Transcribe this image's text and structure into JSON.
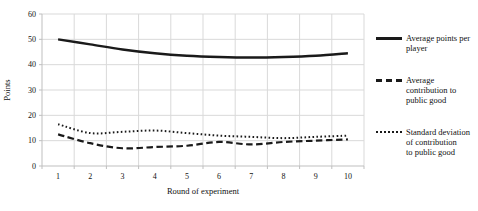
{
  "chart_data": {
    "type": "line",
    "title": "",
    "xlabel": "Round of experiment",
    "ylabel": "Points",
    "categories": [
      "1",
      "2",
      "3",
      "4",
      "5",
      "6",
      "7",
      "8",
      "9",
      "10"
    ],
    "ylim": [
      0,
      60
    ],
    "yticks": [
      0,
      10,
      20,
      30,
      40,
      50,
      60
    ],
    "grid": true,
    "legend_position": "right",
    "series": [
      {
        "name": "Average points per player",
        "legend_lines": [
          "Average points per",
          "player"
        ],
        "style": "solid",
        "values": [
          50,
          48,
          46,
          44.5,
          43.5,
          43,
          42.8,
          43,
          43.5,
          44.5
        ]
      },
      {
        "name": "Average contribution to public good",
        "legend_lines": [
          "Average",
          "contribution to",
          "public good"
        ],
        "style": "dashed",
        "values": [
          12.5,
          9,
          7,
          7.5,
          8,
          9.5,
          8.5,
          9.5,
          10,
          10.5
        ]
      },
      {
        "name": "Standard deviation of contribution to public good",
        "legend_lines": [
          "Standard deviation",
          "of contribution",
          "to public good"
        ],
        "style": "dotted",
        "values": [
          16.5,
          13,
          13.5,
          14,
          13,
          12,
          11.5,
          11,
          11.5,
          12
        ]
      }
    ],
    "colors": {
      "line": "#1a1a1a",
      "grid": "#d9d9d9",
      "axis": "#bfbfbf",
      "text": "#111111"
    }
  }
}
